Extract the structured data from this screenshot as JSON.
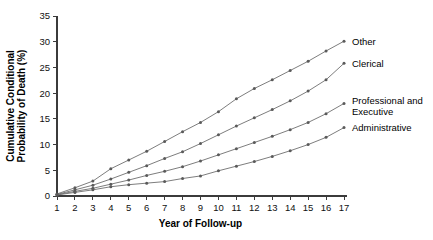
{
  "chart_data": {
    "type": "line",
    "title": "",
    "xlabel": "Year of Follow-up",
    "ylabel": "Cumulative Conditional Probability of Death (%)",
    "ylabel_line1": "Cumulative Conditional",
    "ylabel_line2": "Probability of Death (%)",
    "x": [
      1,
      2,
      3,
      4,
      5,
      6,
      7,
      8,
      9,
      10,
      11,
      12,
      13,
      14,
      15,
      16,
      17
    ],
    "xlim": [
      1,
      17
    ],
    "ylim": [
      0,
      35
    ],
    "xticks": [
      "1",
      "2",
      "3",
      "4",
      "5",
      "6",
      "7",
      "8",
      "9",
      "10",
      "11",
      "12",
      "13",
      "14",
      "15",
      "16",
      "17"
    ],
    "yticks": [
      "0",
      "5",
      "10",
      "15",
      "20",
      "25",
      "30",
      "35"
    ],
    "ytick_values": [
      0,
      5,
      10,
      15,
      20,
      25,
      30,
      35
    ],
    "grid": false,
    "legend_position": "right-inline",
    "line_color": "#6e6e6e",
    "marker_color": "#5a5a5a",
    "axis_color": "#3b3b3b",
    "series": [
      {
        "name": "Other",
        "label": "Other",
        "values": [
          0.4,
          1.6,
          2.9,
          5.3,
          7.0,
          8.7,
          10.6,
          12.5,
          14.3,
          16.4,
          18.9,
          20.9,
          22.6,
          24.4,
          26.2,
          28.2,
          30.1
        ]
      },
      {
        "name": "Clerical",
        "label": "Clerical",
        "values": [
          0.3,
          1.2,
          2.1,
          3.3,
          4.6,
          5.9,
          7.3,
          8.6,
          10.2,
          11.9,
          13.6,
          15.2,
          16.8,
          18.5,
          20.4,
          22.6,
          25.8
        ]
      },
      {
        "name": "Professional and Executive",
        "label_line1": "Professional and",
        "label_line2": "Executive",
        "values": [
          0.25,
          0.9,
          1.5,
          2.3,
          3.1,
          4.0,
          4.8,
          5.7,
          6.8,
          8.0,
          9.2,
          10.4,
          11.6,
          12.9,
          14.3,
          16.0,
          18.0
        ]
      },
      {
        "name": "Administrative",
        "label": "Administrative",
        "values": [
          0.2,
          0.7,
          1.2,
          1.8,
          2.2,
          2.5,
          2.8,
          3.4,
          3.9,
          4.9,
          5.8,
          6.7,
          7.7,
          8.8,
          10.0,
          11.4,
          13.3
        ]
      }
    ]
  }
}
